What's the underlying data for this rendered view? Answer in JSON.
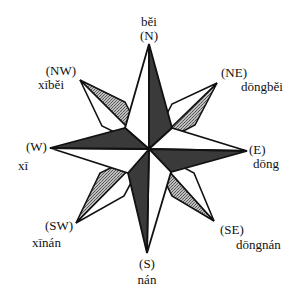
{
  "diagram": {
    "type": "compass-rose",
    "colors": {
      "outline": "#111111",
      "dark_fill": "#3a3a3a",
      "stipple_fill": "#9a9a9a",
      "light_fill": "#ffffff"
    },
    "directions": {
      "n": {
        "abbr": "(N)",
        "pinyin": "běi"
      },
      "ne": {
        "abbr": "(NE)",
        "pinyin": "dōngběi"
      },
      "e": {
        "abbr": "(E)",
        "pinyin": "dōng"
      },
      "se": {
        "abbr": "(SE)",
        "pinyin": "dōngnán"
      },
      "s": {
        "abbr": "(S)",
        "pinyin": "nán"
      },
      "sw": {
        "abbr": "(SW)",
        "pinyin": "xīnán"
      },
      "w": {
        "abbr": "(W)",
        "pinyin": "xī"
      },
      "nw": {
        "abbr": "(NW)",
        "pinyin": "xīběi"
      }
    }
  }
}
